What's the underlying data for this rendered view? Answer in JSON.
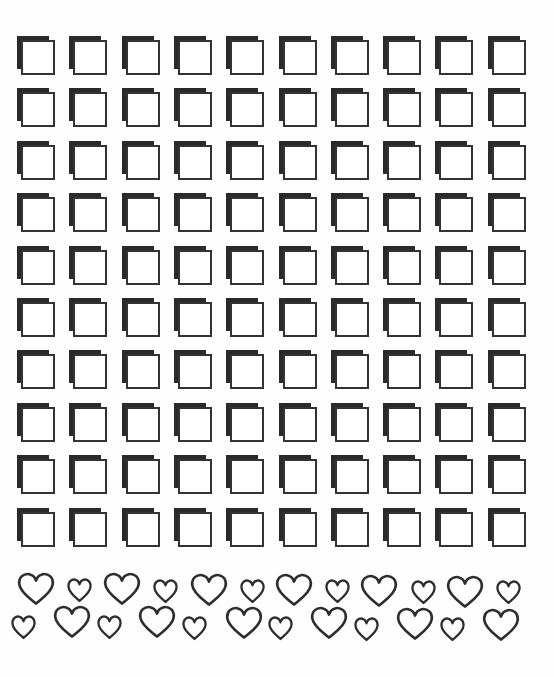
{
  "sheet": {
    "title": "",
    "background": "#fefefe"
  },
  "grid": {
    "rows": 10,
    "columns": 10,
    "origin": [
      17,
      36
    ],
    "col_pitch": 52.3,
    "row_pitch": 52.4,
    "tile": {
      "shape": "checkbox-square",
      "shadow_color": "#2a2a2a",
      "outline_color": "#333333",
      "fill": "#ffffff"
    }
  },
  "hearts": {
    "stroke_color": "#2e2e2e",
    "rows": [
      {
        "name": "top-row",
        "items": [
          {
            "size": "large",
            "x": 17,
            "y": 572
          },
          {
            "size": "small",
            "x": 67,
            "y": 578
          },
          {
            "size": "large",
            "x": 103,
            "y": 572
          },
          {
            "size": "small",
            "x": 153,
            "y": 579
          },
          {
            "size": "large",
            "x": 190,
            "y": 573
          },
          {
            "size": "small",
            "x": 240,
            "y": 579
          },
          {
            "size": "large",
            "x": 275,
            "y": 573
          },
          {
            "size": "small",
            "x": 325,
            "y": 579
          },
          {
            "size": "large",
            "x": 360,
            "y": 574
          },
          {
            "size": "small",
            "x": 411,
            "y": 580
          },
          {
            "size": "large",
            "x": 446,
            "y": 575
          },
          {
            "size": "small",
            "x": 496,
            "y": 580
          }
        ]
      },
      {
        "name": "bottom-row",
        "items": [
          {
            "size": "small",
            "x": 11,
            "y": 615
          },
          {
            "size": "large",
            "x": 53,
            "y": 605
          },
          {
            "size": "small",
            "x": 97,
            "y": 615
          },
          {
            "size": "large",
            "x": 138,
            "y": 605
          },
          {
            "size": "small",
            "x": 182,
            "y": 616
          },
          {
            "size": "large",
            "x": 225,
            "y": 606
          },
          {
            "size": "small",
            "x": 268,
            "y": 616
          },
          {
            "size": "large",
            "x": 310,
            "y": 606
          },
          {
            "size": "small",
            "x": 354,
            "y": 617
          },
          {
            "size": "large",
            "x": 396,
            "y": 607
          },
          {
            "size": "small",
            "x": 440,
            "y": 617
          },
          {
            "size": "large",
            "x": 482,
            "y": 608
          }
        ]
      }
    ],
    "sizes": {
      "large": {
        "w": 38,
        "h": 33
      },
      "small": {
        "w": 25,
        "h": 24
      }
    }
  }
}
